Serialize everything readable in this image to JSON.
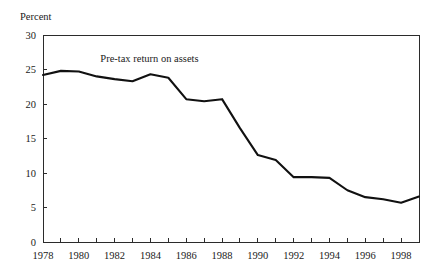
{
  "chart_data": {
    "type": "line",
    "title": "",
    "subtitle": "",
    "xlabel": "",
    "ylabel": "Percent",
    "ylabel_position": "above-axis-top-left",
    "grid": false,
    "legend": "none",
    "annotations": [
      {
        "text": "Pre-tax return on assets",
        "x": 1981.2,
        "y": 26.1
      }
    ],
    "xlim": [
      1978,
      1999
    ],
    "ylim": [
      0,
      30
    ],
    "y_ticks": [
      0,
      5,
      10,
      15,
      20,
      25,
      30
    ],
    "y_tick_labels": [
      "0",
      "5",
      "10",
      "15",
      "20",
      "25",
      "30"
    ],
    "x_ticks": [
      1978,
      1979,
      1980,
      1981,
      1982,
      1983,
      1984,
      1985,
      1986,
      1987,
      1988,
      1989,
      1990,
      1991,
      1992,
      1993,
      1994,
      1995,
      1996,
      1997,
      1998,
      1999
    ],
    "x_tick_labels_shown": [
      "1978",
      "1980",
      "1982",
      "1984",
      "1986",
      "1988",
      "1990",
      "1992",
      "1994",
      "1996",
      "1998"
    ],
    "x_labeled_ticks": [
      1978,
      1980,
      1982,
      1984,
      1986,
      1988,
      1990,
      1992,
      1994,
      1996,
      1998
    ],
    "x": [
      1978,
      1979,
      1980,
      1981,
      1982,
      1983,
      1984,
      1985,
      1986,
      1987,
      1988,
      1989,
      1990,
      1991,
      1992,
      1993,
      1994,
      1995,
      1996,
      1997,
      1998,
      1999
    ],
    "series": [
      {
        "name": "Pre-tax return on assets",
        "color": "#111111",
        "values": [
          24.2,
          24.8,
          24.7,
          24.0,
          23.6,
          23.3,
          24.3,
          23.8,
          20.7,
          20.4,
          20.7,
          16.5,
          12.6,
          11.9,
          9.4,
          9.4,
          9.3,
          7.5,
          6.5,
          6.2,
          5.7,
          6.6
        ]
      }
    ]
  },
  "axis": {
    "y_title": "Percent"
  }
}
